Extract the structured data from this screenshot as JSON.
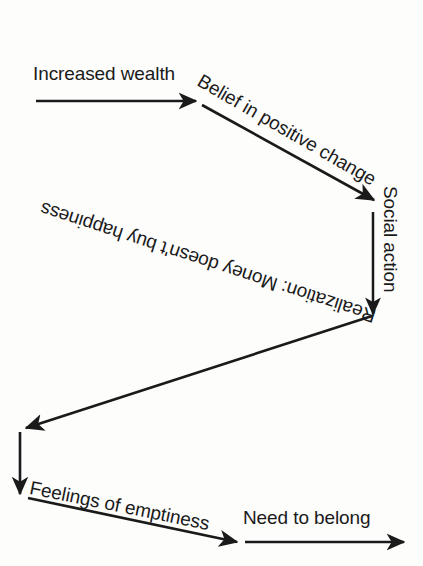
{
  "diagram": {
    "type": "cycle-flow-chart",
    "title": "",
    "background_color": "#fdfdfc",
    "ink_color": "#1a1a1a",
    "nodes": [
      {
        "id": "increased-wealth",
        "label": "Increased wealth"
      },
      {
        "id": "belief-positive-change",
        "label": "Belief in positive change"
      },
      {
        "id": "social-action",
        "label": "Social action"
      },
      {
        "id": "realization",
        "label": "Realization: Money doesn't buy happiness"
      },
      {
        "id": "feelings-emptiness",
        "label": "Feelings of emptiness"
      },
      {
        "id": "need-to-belong",
        "label": "Need to belong"
      }
    ],
    "arrows": [
      {
        "id": "arrow-increased-wealth",
        "from": "Increased wealth",
        "direction": "right",
        "label_orientation": "horizontal"
      },
      {
        "id": "arrow-belief-positive-change",
        "from": "Belief in positive change",
        "direction": "down-right",
        "label_orientation": "rotated-30"
      },
      {
        "id": "arrow-social-action",
        "from": "Social action",
        "direction": "down",
        "label_orientation": "rotated-90"
      },
      {
        "id": "arrow-realization",
        "from": "Realization: Money doesn't buy happiness",
        "direction": "down-left",
        "label_orientation": "rotated-198"
      },
      {
        "id": "arrow-feelings-emptiness",
        "from": "Feelings of emptiness",
        "direction": "down-right",
        "label_orientation": "rotated-11"
      },
      {
        "id": "arrow-need-to-belong",
        "from": "Need to belong",
        "direction": "right",
        "label_orientation": "horizontal"
      }
    ]
  }
}
